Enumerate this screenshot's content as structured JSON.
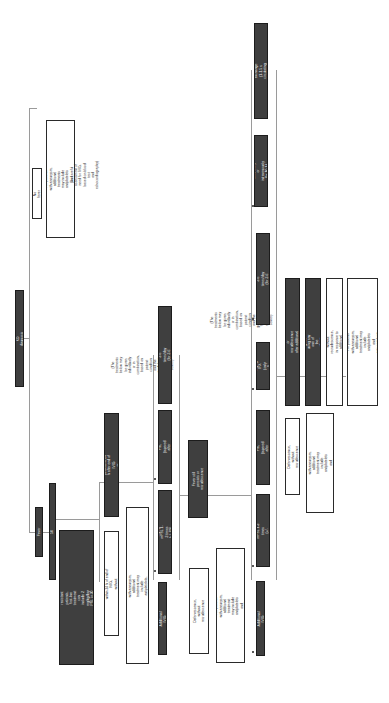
{
  "diagram": {
    "orientation": "rotated 90 degrees clockwise; text reads bottom-to-top",
    "root": "KD diagnosis",
    "branches": {
      "no_fever": {
        "label": "No fever",
        "treatment": "5 mg/kg/day ASA in 1 dose\nFor patients with aneurysm, additional treatments may include\nantiplatelets and anticoagulants, according to severity",
        "note": "(Do careful assessment of need for IVIG, based on blood test\nand echocardiography)"
      },
      "fever": {
        "label": "Fever",
        "initial": "2 g/kg IVIG + 30-50 mg/kg/day ASA",
        "risk_box": "Stratify patients according to risk score. For suspected IVIG-\nresistant patients, first-line treatment can include 2\nmg/kg/day PSL or 30 mg/kg mPSL, given together with IVIG\nplus ASA doses",
        "response_good": "Fever resolves within 24 h of end of IVIG,\nwithout microdefervescence",
        "response_good_tx": "Reduce ASA to 5 mg/kg/day\nFor patients with aneurysm, additional treatment may include\nantiplatelets, anticoagulants, according to severity",
        "response_bad": "Fever still persists at 24 h after end of IVIG\nor recrudescence",
        "note_1": "(The treatments below may be given individually or in combination, based on\npatient condition and the guidelines for each medical center)",
        "second_line": [
          "Additional IVIG",
          "10-30 mg/kg mPSL 1-3 times\n(+/- PSL tapering)",
          "2 mg/kg/day PSL (tapered after\nCRP normalized)",
          "5000 U/kg/UTI, 3-6 times/day (for 3-6\ndays to 1 week)"
        ],
        "second_response_good": "Defervescence, without\nrecrudescence",
        "second_response_good_tx": "Reduce ASA to 5 mg/kg/day\nFor patients with aneurysm, additional treatment\nmay include antiplatelets and anticoagulants,\naccording to severity",
        "second_response_bad": "Fever still persists or recrudescence",
        "note_2": "(The treatments below may be given individually or in combination, based on\npatient condition and the guidelines for each medical center)",
        "third_line": [
          "Additional IVIG",
          "10-30 mg/kg mPSL 1-3 times\n(+/- subsequent PSL)",
          "2 mg/kg/day PSL (tapered after\nCRP normalized)",
          "5 mg/kg IFX\n(only 1 dose)",
          "5000 U/kg/UTI, 3-6 times/day (for 3-6\ndays to 1 week)",
          "4 mg/kg/day CsA, orally or\nintravenously (for 10-14 days)",
          "3-5 days plasma exchange (1-1.5 x\ncirculating blood volume)"
        ],
        "third_response_good": "Defervescence, without\nrecrudescence",
        "third_response_good_tx": "Reduce ASA to 5 mg/kg/day\nFor patients with aneurysm, additional treatment may include\nantiplatelets and anticoagulants, according to severity",
        "third_response_bad": "Fever persists or recrudescence after additional therapy",
        "third_response_bad_tx": "Additional therapy may be given using any one of the\nabove options except IVIG",
        "fourth_response_good": "Defervescence, without recrudescence, in response to\nadditional therapy",
        "fourth_response_good_tx": "Reduce ASA to 5 mg/kg/day\nFor patients with aneurysm, additional treatment may\ninclude antiplatelets and anticoagulants, according to\nseverity"
      }
    }
  }
}
